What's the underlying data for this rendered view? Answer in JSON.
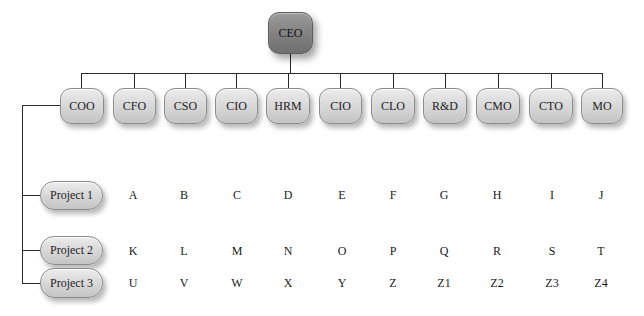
{
  "diagram": {
    "type": "org-chart-matrix",
    "root": {
      "label": "CEO"
    },
    "roles": [
      "COO",
      "CFO",
      "CSO",
      "CIO",
      "HRM",
      "CIO",
      "CLO",
      "R&D",
      "CMO",
      "CTO",
      "MO"
    ],
    "projects": [
      {
        "label": "Project 1",
        "cells": [
          "A",
          "B",
          "C",
          "D",
          "E",
          "F",
          "G",
          "H",
          "I",
          "J"
        ]
      },
      {
        "label": "Project 2",
        "cells": [
          "K",
          "L",
          "M",
          "N",
          "O",
          "P",
          "Q",
          "R",
          "S",
          "T"
        ]
      },
      {
        "label": "Project 3",
        "cells": [
          "U",
          "V",
          "W",
          "X",
          "Y",
          "Z",
          "Z1",
          "Z2",
          "Z3",
          "Z4"
        ]
      }
    ]
  },
  "colors": {
    "node_fill": "#d6d6d6",
    "root_fill": "#7e7e7e",
    "connector": "#2a2a2a",
    "background": "#ffffff"
  }
}
